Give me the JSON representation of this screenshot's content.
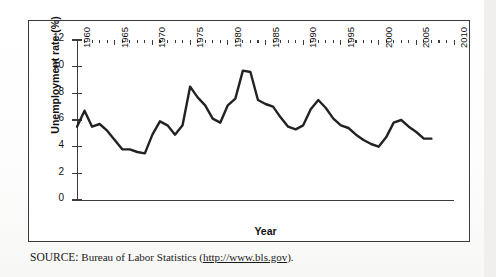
{
  "figure": {
    "source_prefix": "SOURCE:",
    "source_text": "Bureau of Labor Statistics (",
    "source_url": "http://www.bls.gov",
    "source_suffix": ")."
  },
  "chart_data": {
    "type": "line",
    "title": "",
    "xlabel": "Year",
    "ylabel": "Unemployment rate (%)",
    "xlim": [
      1960,
      2010
    ],
    "ylim": [
      0,
      12
    ],
    "ytick_labels": [
      "0",
      "2",
      "4",
      "6",
      "8",
      "10",
      "12"
    ],
    "yticks": [
      0,
      2,
      4,
      6,
      8,
      10,
      12
    ],
    "xtick_labels": [
      "1960",
      "1965",
      "1970",
      "1975",
      "1980",
      "1985",
      "1990",
      "1995",
      "2000",
      "2005",
      "2010"
    ],
    "xticks": [
      1960,
      1965,
      1970,
      1975,
      1980,
      1985,
      1990,
      1995,
      2000,
      2005,
      2010
    ],
    "xtick_rotation": -90,
    "grid": false,
    "legend": "none",
    "line_color": "#222222",
    "line_width": 2.4,
    "x": [
      1960,
      1961,
      1962,
      1963,
      1964,
      1965,
      1966,
      1967,
      1968,
      1969,
      1970,
      1971,
      1972,
      1973,
      1974,
      1975,
      1976,
      1977,
      1978,
      1979,
      1980,
      1981,
      1982,
      1983,
      1984,
      1985,
      1986,
      1987,
      1988,
      1989,
      1990,
      1991,
      1992,
      1993,
      1994,
      1995,
      1996,
      1997,
      1998,
      1999,
      2000,
      2001,
      2002,
      2003,
      2004,
      2005,
      2006,
      2007
    ],
    "values": [
      5.5,
      6.7,
      5.5,
      5.7,
      5.2,
      4.5,
      3.8,
      3.8,
      3.6,
      3.5,
      4.9,
      5.9,
      5.6,
      4.9,
      5.6,
      8.5,
      7.7,
      7.1,
      6.1,
      5.8,
      7.1,
      7.6,
      9.7,
      9.6,
      7.5,
      7.2,
      7.0,
      6.2,
      5.5,
      5.3,
      5.6,
      6.8,
      7.5,
      6.9,
      6.1,
      5.6,
      5.4,
      4.9,
      4.5,
      4.2,
      4.0,
      4.7,
      5.8,
      6.0,
      5.5,
      5.1,
      4.6,
      4.6
    ],
    "series_name": "Unemployment rate"
  }
}
